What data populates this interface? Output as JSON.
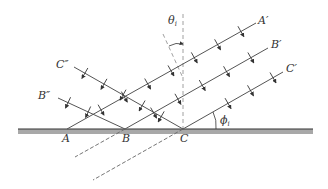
{
  "figure": {
    "labels": {
      "A": "A",
      "B": "B",
      "C": "C",
      "A_prime": "A′",
      "B_prime": "B′",
      "C_prime": "C′",
      "B_double": "B″",
      "C_double": "C″",
      "theta": "θ",
      "theta_sub": "i",
      "phi": "ϕ",
      "phi_sub": "i"
    },
    "colors": {
      "line": "#555555",
      "surface_top": "#333333",
      "surface_band": "#a8a8a8",
      "dashed": "#777777",
      "ghost": "#cccccc"
    }
  }
}
